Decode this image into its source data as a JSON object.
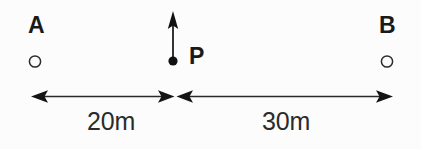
{
  "diagram": {
    "background_color": "#fcfcfc",
    "stroke_color": "#1a1a1a",
    "points": [
      {
        "id": "A",
        "label": "A",
        "marker": "open-circle",
        "x_px": 35,
        "y_px": 61
      },
      {
        "id": "P",
        "label": "P",
        "marker": "filled-dot",
        "x_px": 173,
        "y_px": 61
      },
      {
        "id": "B",
        "label": "B",
        "marker": "open-circle",
        "x_px": 387,
        "y_px": 61
      }
    ],
    "vector": {
      "name": "velocity-arrow-at-p",
      "direction": "up",
      "origin_x_px": 173,
      "origin_y_px": 61,
      "tip_y_px": 12
    },
    "dimensions": [
      {
        "id": "left-span",
        "label": "20m",
        "value": 20,
        "unit": "m",
        "from": "A",
        "to": "P",
        "arrow_style": "double-headed"
      },
      {
        "id": "right-span",
        "label": "30m",
        "value": 30,
        "unit": "m",
        "from": "P",
        "to": "B",
        "arrow_style": "double-headed"
      }
    ]
  }
}
